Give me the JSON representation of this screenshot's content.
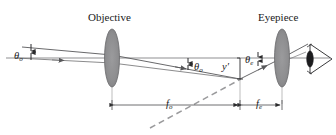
{
  "figure": {
    "type": "optical-ray-diagram",
    "background_color": "#ffffff",
    "line_color": "#58585a",
    "lens_fill_color": "#8a8a8c",
    "text_color": "#1a1a1a",
    "dashed_color": "#8a8a8c"
  },
  "labels": {
    "objective_title": "Objective",
    "eyepiece_title": "Eyepiece",
    "theta_o_left": {
      "symbol": "θ",
      "sub": "o"
    },
    "theta_o_mid": {
      "symbol": "θ",
      "sub": "o"
    },
    "theta_e": {
      "symbol": "θ",
      "sub": "e"
    },
    "image_height": {
      "symbol": "y",
      "prime": "′"
    },
    "focal_objective": {
      "symbol": "f",
      "sub": "o"
    },
    "focal_eyepiece": {
      "symbol": "f",
      "sub": "e"
    }
  },
  "components": [
    {
      "name": "objective-lens",
      "type": "biconvex-lens",
      "x": 112,
      "axis_y": 58
    },
    {
      "name": "eyepiece-lens",
      "type": "biconvex-lens",
      "x": 282,
      "axis_y": 58
    },
    {
      "name": "eye",
      "type": "observer-eye",
      "x": 312,
      "axis_y": 58
    },
    {
      "name": "optical-axis",
      "type": "horizontal-line",
      "y": 58
    },
    {
      "name": "intermediate-image",
      "type": "image-point",
      "x": 240,
      "y": 79
    }
  ],
  "dimensions": {
    "focal_objective_span": {
      "from_x": 112,
      "to_x": 240,
      "y": 105
    },
    "focal_eyepiece_span": {
      "from_x": 240,
      "to_x": 282,
      "y": 105
    }
  },
  "canvas": {
    "width": 336,
    "height": 135
  }
}
